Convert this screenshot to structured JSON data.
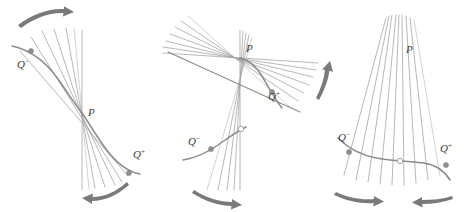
{
  "figure": {
    "background_color": "#ffffff",
    "curve_color": "#8c8c8c",
    "secant_color": "#9a9a9a",
    "label_color": "#3d3d3d",
    "arrow_color": "#7a7a7a",
    "panel_count": 3
  },
  "panels": [
    {
      "id": "panel-left",
      "name": "vertical-tangent-panel",
      "labels": {
        "point_p": "P",
        "q_minus": "Q",
        "q_minus_sup": "−",
        "q_plus": "Q",
        "q_plus_sup": "+"
      },
      "markers": {
        "p_kind": "intersection",
        "q_minus_kind": "filled-dot",
        "q_plus_kind": "filled-dot"
      },
      "arrows": [
        {
          "name": "arrow-top-right",
          "direction": "right",
          "curvature": "concave-down"
        },
        {
          "name": "arrow-bottom-left",
          "direction": "left",
          "curvature": "concave-up"
        }
      ]
    },
    {
      "id": "panel-middle",
      "name": "horizontal-tangent-panel",
      "labels": {
        "point_p": "P",
        "q_minus": "Q",
        "q_minus_sup": "−",
        "q_plus": "Q",
        "q_plus_sup": "+"
      },
      "markers": {
        "p_kind": "intersection",
        "q_minus_kind": "filled-dot",
        "q_plus_kind": "filled-dot",
        "extra_kind": "open-dot"
      },
      "arrows": [
        {
          "name": "arrow-bottom-right",
          "direction": "right",
          "curvature": "concave-up"
        },
        {
          "name": "arrow-right-up",
          "direction": "up-right",
          "curvature": "concave-left"
        }
      ]
    },
    {
      "id": "panel-right",
      "name": "cusp-tangent-panel",
      "labels": {
        "point_p": "P",
        "q_minus": "Q",
        "q_minus_sup": "−",
        "q_plus": "Q",
        "q_plus_sup": "+"
      },
      "markers": {
        "p_kind": "convergence",
        "q_minus_kind": "filled-dot",
        "q_plus_kind": "filled-dot",
        "extra_kind": "open-dot"
      },
      "arrows": [
        {
          "name": "arrow-bottom-left-inward",
          "direction": "right",
          "curvature": "concave-up"
        },
        {
          "name": "arrow-bottom-right-inward",
          "direction": "left",
          "curvature": "flat"
        }
      ]
    }
  ]
}
